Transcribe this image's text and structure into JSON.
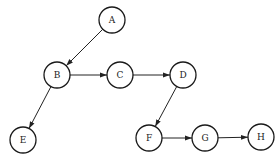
{
  "diagram": {
    "type": "directed-graph",
    "nodes": [
      {
        "id": "A",
        "label": "A",
        "x": 112,
        "y": 20
      },
      {
        "id": "B",
        "label": "B",
        "x": 57,
        "y": 75
      },
      {
        "id": "C",
        "label": "C",
        "x": 120,
        "y": 75
      },
      {
        "id": "D",
        "label": "D",
        "x": 183,
        "y": 75
      },
      {
        "id": "E",
        "label": "E",
        "x": 23,
        "y": 140
      },
      {
        "id": "F",
        "label": "F",
        "x": 149,
        "y": 138
      },
      {
        "id": "G",
        "label": "G",
        "x": 205,
        "y": 138
      },
      {
        "id": "H",
        "label": "H",
        "x": 261,
        "y": 137
      }
    ],
    "edges": [
      {
        "from": "A",
        "to": "B"
      },
      {
        "from": "B",
        "to": "C"
      },
      {
        "from": "C",
        "to": "D"
      },
      {
        "from": "B",
        "to": "E"
      },
      {
        "from": "D",
        "to": "F"
      },
      {
        "from": "F",
        "to": "G"
      },
      {
        "from": "G",
        "to": "H"
      }
    ],
    "node_radius": 13,
    "colors": {
      "stroke": "#1a1a1a",
      "fill": "#ffffff",
      "text": "#222222"
    }
  }
}
